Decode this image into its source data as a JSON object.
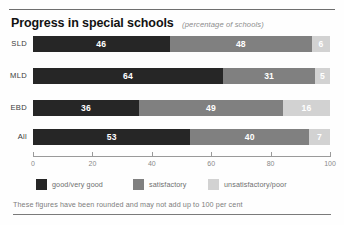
{
  "figure": {
    "title": "Progress in special schools",
    "subtitle": "(percentage of schools)",
    "footnote": "These figures have been rounded and may not add up to 100 per cent"
  },
  "colors": {
    "good": "#262626",
    "satisfactory": "#808080",
    "unsatisfactory": "#d2d2d2",
    "axis": "#9a9a9a",
    "rule": "#6e6e6e",
    "label": "#3a3a3a",
    "muted": "#8a8a8a"
  },
  "legend": [
    {
      "label": "good/very good",
      "key": "good"
    },
    {
      "label": "satisfactory",
      "key": "satisfactory"
    },
    {
      "label": "unsatisfactory/poor",
      "key": "unsatisfactory"
    }
  ],
  "axis": {
    "ticks": [
      "0",
      "20",
      "40",
      "60",
      "80",
      "100"
    ]
  },
  "rows": [
    {
      "label": "SLD",
      "good": "46",
      "satisfactory": "48",
      "unsatisfactory": "6"
    },
    {
      "label": "MLD",
      "good": "64",
      "satisfactory": "31",
      "unsatisfactory": "5"
    },
    {
      "label": "EBD",
      "good": "36",
      "satisfactory": "49",
      "unsatisfactory": "16"
    },
    {
      "label": "All",
      "good": "53",
      "satisfactory": "40",
      "unsatisfactory": "7"
    }
  ],
  "chart_data": {
    "type": "bar",
    "orientation": "horizontal",
    "stacked": true,
    "stacked_mode": "percent",
    "title": "Progress in special schools",
    "subtitle": "(percentage of schools)",
    "xlabel": "",
    "ylabel": "",
    "xlim": [
      0,
      100
    ],
    "xticks": [
      0,
      20,
      40,
      60,
      80,
      100
    ],
    "grid": false,
    "legend_position": "bottom",
    "categories": [
      "SLD",
      "MLD",
      "EBD",
      "All"
    ],
    "series": [
      {
        "name": "good/very good",
        "color": "#262626",
        "values": [
          46,
          64,
          36,
          53
        ]
      },
      {
        "name": "satisfactory",
        "color": "#808080",
        "values": [
          48,
          31,
          49,
          40
        ]
      },
      {
        "name": "unsatisfactory/poor",
        "color": "#d2d2d2",
        "values": [
          6,
          5,
          16,
          7
        ]
      }
    ],
    "annotations": [
      "These figures have been rounded and may not add up to 100 per cent"
    ]
  }
}
